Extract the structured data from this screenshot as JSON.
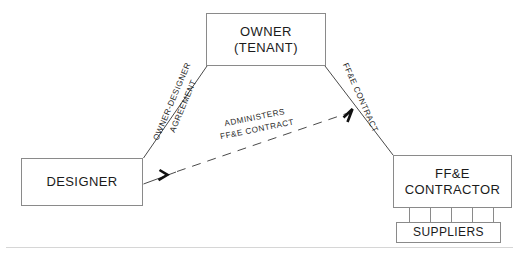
{
  "diagram": {
    "type": "organizational-relationship-diagram",
    "colors": {
      "box_border": "#8a8a8a",
      "line": "#4a4a4a",
      "text": "#1b1b1b",
      "label_text": "#2a2a2a",
      "background": "#ffffff",
      "rule": "#d6d6d6"
    },
    "nodes": [
      {
        "id": "owner",
        "line1": "OWNER",
        "line2": "(TENANT)"
      },
      {
        "id": "designer",
        "line1": "DESIGNER",
        "line2": ""
      },
      {
        "id": "contractor",
        "line1": "FF&E",
        "line2": "CONTRACTOR"
      },
      {
        "id": "suppliers",
        "line1": "SUPPLIERS",
        "line2": ""
      }
    ],
    "edges": [
      {
        "id": "owner-designer",
        "from": "owner",
        "to": "designer",
        "style": "solid",
        "arrow": false,
        "label_line1": "OWNER-DESIGNER",
        "label_line2": "AGREEMENT"
      },
      {
        "id": "owner-contractor",
        "from": "owner",
        "to": "contractor",
        "style": "solid",
        "arrow": false,
        "label_line1": "FF&E   CONTRACT",
        "label_line2": ""
      },
      {
        "id": "designer-administers",
        "from": "designer",
        "to": "contractor",
        "style": "dashed",
        "arrow": true,
        "label_line1": "ADMINISTERS",
        "label_line2": "FF&E   CONTRACT"
      },
      {
        "id": "contractor-suppliers",
        "from": "contractor",
        "to": "suppliers",
        "style": "solid",
        "arrow": false,
        "label_line1": "",
        "label_line2": "",
        "connector_count": 5
      }
    ]
  }
}
